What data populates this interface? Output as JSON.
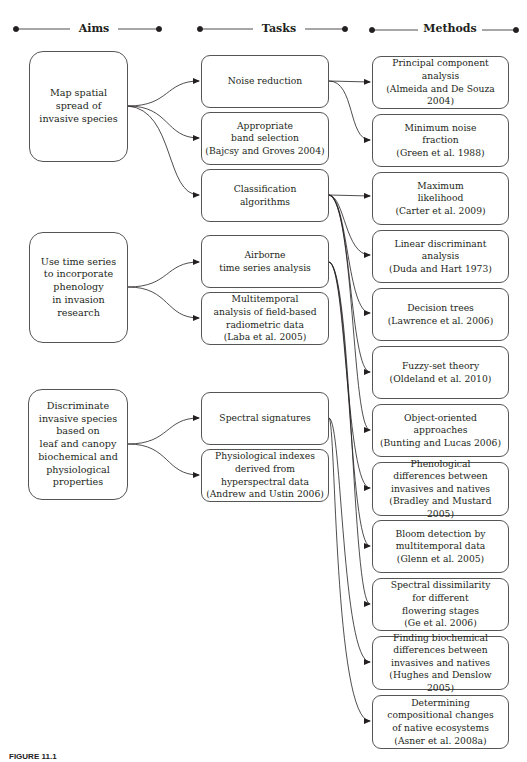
{
  "headers": {
    "aims": "Aims",
    "tasks": "Tasks",
    "methods": "Methods"
  },
  "aims": [
    {
      "label": "Map spatial\nspread of\ninvasive species"
    },
    {
      "label": "Use time series\nto incorporate\nphenology\nin invasion\nresearch"
    },
    {
      "label": "Discriminate\ninvasive species\nbased on\nleaf and canopy\nbiochemical and\nphysiological\nproperties"
    }
  ],
  "tasks": [
    {
      "label": "Noise reduction"
    },
    {
      "label": "Appropriate\nband selection\n(Bajcsy and Groves 2004)"
    },
    {
      "label": "Classification\nalgorithms"
    },
    {
      "label": "Airborne\ntime series analysis"
    },
    {
      "label": "Multitemporal\nanalysis of field-based\nradiometric data\n(Laba et al. 2005)"
    },
    {
      "label": "Spectral signatures"
    },
    {
      "label": "Physiological indexes\nderived from\nhyperspectral data\n(Andrew and Ustin 2006)"
    }
  ],
  "methods": [
    {
      "label": "Principal component\nanalysis\n(Almeida and De Souza 2004)"
    },
    {
      "label": "Minimum noise\nfraction\n(Green et al. 1988)"
    },
    {
      "label": "Maximum\nlikelihood\n(Carter et al. 2009)"
    },
    {
      "label": "Linear discriminant\nanalysis\n(Duda and Hart 1973)"
    },
    {
      "label": "Decision trees\n(Lawrence et al. 2006)"
    },
    {
      "label": "Fuzzy-set theory\n(Oldeland et al. 2010)"
    },
    {
      "label": "Object-oriented\napproaches\n(Bunting and Lucas 2006)"
    },
    {
      "label": "Phenological\ndifferences between\ninvasives and natives\n(Bradley and Mustard 2005)"
    },
    {
      "label": "Bloom detection by\nmultitemporal data\n(Glenn et al. 2005)"
    },
    {
      "label": "Spectral dissimilarity\nfor different\nflowering stages\n(Ge et al. 2006)"
    },
    {
      "label": "Finding biochemical\ndifferences between\ninvasives and natives\n(Hughes and Denslow 2005)"
    },
    {
      "label": "Determining\ncompositional changes\nof native ecosystems\n(Asner et al. 2008a)"
    }
  ],
  "caption": "FIGURE 11.1"
}
